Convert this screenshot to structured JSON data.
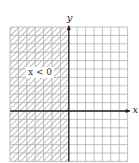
{
  "figure": {
    "type": "inequality-graph",
    "region_label": "x < 0",
    "shaded_side": "left",
    "boundary": "x = 0 (y-axis)",
    "axes": {
      "x_label": "x",
      "y_label": "y"
    },
    "grid": {
      "cols": 14,
      "rows": 16,
      "cols_left_of_y_axis": 7,
      "rows_above_x_axis": 10
    },
    "colors": {
      "grid_line": "#b0b0b0",
      "axis": "#222222",
      "hatch": "#8a8a8a",
      "background": "#ffffff"
    }
  }
}
